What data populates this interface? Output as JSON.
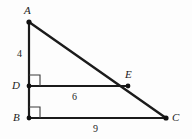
{
  "figure": {
    "kind": "geometry-diagram",
    "background_color": "#fdfdfd",
    "stroke_color": "#1b1b1b"
  },
  "vertices": [
    {
      "id": "A",
      "label": "A",
      "x": 29,
      "y": 22,
      "dot": true
    },
    {
      "id": "D",
      "label": "D",
      "x": 29,
      "y": 86,
      "dot": true
    },
    {
      "id": "B",
      "label": "B",
      "x": 29,
      "y": 118,
      "dot": true
    },
    {
      "id": "C",
      "label": "C",
      "x": 166,
      "y": 118,
      "dot": true
    },
    {
      "id": "E",
      "label": "E",
      "x": 128,
      "y": 86,
      "dot": true
    }
  ],
  "segments": [
    {
      "id": "AB",
      "from": "A",
      "to": "B",
      "x1": 29,
      "y1": 22,
      "x2": 29,
      "y2": 118,
      "width": 2.2
    },
    {
      "id": "AC",
      "from": "A",
      "to": "C",
      "x1": 29,
      "y1": 22,
      "x2": 166,
      "y2": 118,
      "width": 2.4
    },
    {
      "id": "BC",
      "from": "B",
      "to": "C",
      "x1": 29,
      "y1": 118,
      "x2": 166,
      "y2": 118,
      "width": 2.2
    },
    {
      "id": "DE",
      "from": "D",
      "to": "E",
      "x1": 29,
      "y1": 86,
      "x2": 128,
      "y2": 86,
      "width": 1.8
    }
  ],
  "right_angles": [
    {
      "id": "angle-D",
      "at": "D",
      "x": 29,
      "y": 86,
      "size": 11
    },
    {
      "id": "angle-B",
      "at": "B",
      "x": 29,
      "y": 118,
      "size": 11
    }
  ],
  "measures": [
    {
      "id": "AD",
      "value": "4",
      "segment": "AD",
      "x": 17,
      "y": 49
    },
    {
      "id": "DE",
      "value": "6",
      "segment": "DE",
      "x": 72,
      "y": 92
    },
    {
      "id": "BC",
      "value": "9",
      "segment": "BC",
      "x": 93,
      "y": 124
    }
  ]
}
